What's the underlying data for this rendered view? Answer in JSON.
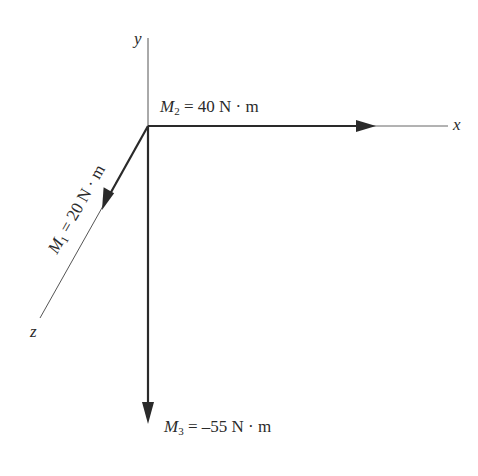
{
  "figure": {
    "type": "3D moment vector diagram",
    "origin": {
      "x": 148,
      "y": 126
    }
  },
  "axes": {
    "x": {
      "label": "x"
    },
    "y": {
      "label": "y"
    },
    "z": {
      "label": "z"
    }
  },
  "moments": [
    {
      "id": "M1",
      "symbol": "M",
      "subscript": "1",
      "equals": "=",
      "value": "20 N · m",
      "direction": "+z"
    },
    {
      "id": "M2",
      "symbol": "M",
      "subscript": "2",
      "equals": "=",
      "value": "40 N · m",
      "direction": "+x"
    },
    {
      "id": "M3",
      "symbol": "M",
      "subscript": "3",
      "equals": "=",
      "value": "–55 N · m",
      "direction": "-y"
    }
  ],
  "colors": {
    "stroke": "#2a2a2a",
    "axis": "#555555",
    "background": "#ffffff"
  }
}
